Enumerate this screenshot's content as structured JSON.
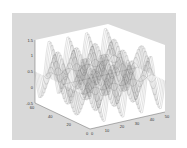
{
  "chart_data": {
    "type": "mesh3d",
    "title": "",
    "xlabel": "",
    "ylabel": "",
    "zlabel": "",
    "function": "z = sin(x) * cos(y) style oscillating surface",
    "x_ticks": [
      "0",
      "10",
      "20",
      "30",
      "40",
      "50"
    ],
    "y_ticks": [
      "0",
      "20",
      "40",
      "60"
    ],
    "z_ticks": [
      "-0.5",
      "0",
      "0.5",
      "1",
      "1.5"
    ],
    "xlim": [
      0,
      50
    ],
    "ylim": [
      0,
      60
    ],
    "zlim": [
      -0.5,
      1.5
    ],
    "grid": false,
    "view": "3d default azimuth/elevation",
    "colors": {
      "figure_bg": "#d9d9d9",
      "axes_bg": "#ffffff",
      "mesh": "#555555"
    }
  }
}
